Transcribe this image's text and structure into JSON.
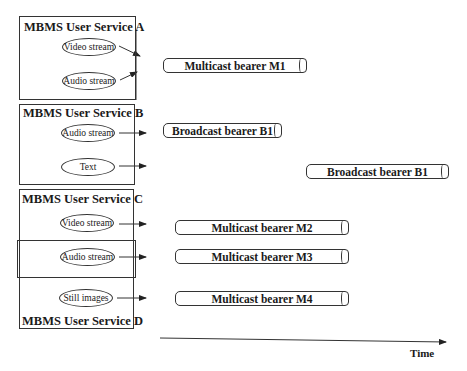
{
  "diagram": {
    "type": "mbms-service-to-bearer-mapping",
    "services": [
      {
        "id": "A",
        "title": "MBMS User Service A",
        "streams": [
          "Video stream",
          "Audio stream"
        ]
      },
      {
        "id": "B",
        "title": "MBMS User Service B",
        "streams": [
          "Audio stream",
          "Text"
        ]
      },
      {
        "id": "C",
        "title": "MBMS User Service C",
        "streams": [
          "Video stream",
          "Audio stream"
        ]
      },
      {
        "id": "D",
        "title": "MBMS User Service D",
        "streams": [
          "Audio stream",
          "Still images"
        ]
      }
    ],
    "bearers": [
      {
        "label": "Multicast bearer M1"
      },
      {
        "label": "Broadcast bearer B1"
      },
      {
        "label": "Broadcast bearer B1"
      },
      {
        "label": "Multicast bearer M2"
      },
      {
        "label": "Multicast bearer M3"
      },
      {
        "label": "Multicast bearer M4"
      }
    ],
    "ellipses": {
      "a_video": "Video stream",
      "a_audio": "Audio stream",
      "b_audio": "Audio stream",
      "b_text": "Text",
      "c_video": "Video stream",
      "cd_audio": "Audio stream",
      "d_still": "Still images"
    },
    "axis": {
      "label": "Time"
    },
    "colors": {
      "line": "#333333",
      "background": "#ffffff"
    }
  }
}
